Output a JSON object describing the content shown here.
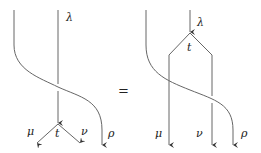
{
  "diagram": {
    "type": "string-diagram-equation",
    "equals_sign": "=",
    "stroke_color": "#555555",
    "left": {
      "labels": {
        "lambda": "λ",
        "vertex": "t",
        "mu": "μ",
        "nu": "ν",
        "rho": "ρ"
      }
    },
    "right": {
      "labels": {
        "lambda": "λ",
        "vertex": "t",
        "mu": "μ",
        "nu": "ν",
        "rho": "ρ"
      }
    }
  }
}
